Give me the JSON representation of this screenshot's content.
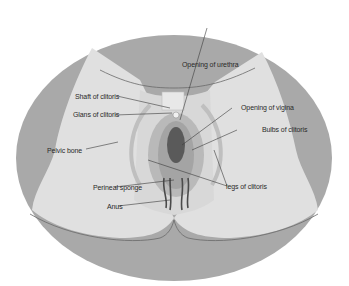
{
  "diagram": {
    "type": "anatomical-illustration",
    "colors": {
      "background": "#ffffff",
      "outer_ellipse": "#a9a9a9",
      "thigh_fill": "#e0e0e0",
      "central_gray": "#bcbcbc",
      "vaginal_opening": "#5a5a5a",
      "leader_lines": "#3a3a3a"
    },
    "labels": [
      {
        "id": "opening-of-urethra",
        "text": "Opening of urethra"
      },
      {
        "id": "shaft-of-clitoris",
        "text": "Shaft of clitoris"
      },
      {
        "id": "glans-of-clitoris",
        "text": "Glans of clitoris"
      },
      {
        "id": "opening-of-vagina",
        "text": "Opening of vigina"
      },
      {
        "id": "bulbs-of-clitoris",
        "text": "Bulbs of clitoris"
      },
      {
        "id": "pelvic-bone",
        "text": "Pelvic bone"
      },
      {
        "id": "perineal-sponge",
        "text": "Perineal sponge"
      },
      {
        "id": "legs-of-clitoris",
        "text": "legs of clitoris"
      },
      {
        "id": "anus",
        "text": "Anus"
      }
    ]
  }
}
